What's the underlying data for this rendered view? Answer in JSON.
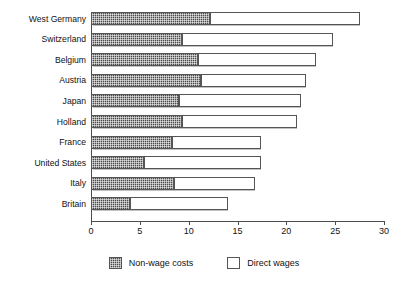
{
  "chart_data": {
    "type": "bar",
    "orientation": "horizontal",
    "stacked": true,
    "title": "",
    "xlabel": "",
    "ylabel": "",
    "xlim": [
      0,
      30
    ],
    "xticks": [
      0,
      5,
      10,
      15,
      20,
      25,
      30
    ],
    "xtick_labels": [
      "0",
      "5",
      "10",
      "15",
      "20",
      "25",
      "30"
    ],
    "grid": false,
    "legend_position": "bottom",
    "categories": [
      "West Germany",
      "Switzerland",
      "Belgium",
      "Austria",
      "Japan",
      "Holland",
      "France",
      "United States",
      "Italy",
      "Britain"
    ],
    "series": [
      {
        "name": "Non-wage costs",
        "color": "#4a4a4a",
        "fill": "checkered-dark",
        "values": [
          12.2,
          9.3,
          11.0,
          11.3,
          9.0,
          9.3,
          8.3,
          5.4,
          8.5,
          4.0
        ]
      },
      {
        "name": "Direct wages",
        "color": "#ffffff",
        "fill": "white",
        "values": [
          15.3,
          15.5,
          12.0,
          10.7,
          12.5,
          11.8,
          9.1,
          12.0,
          8.3,
          10.0
        ]
      }
    ],
    "totals": [
      27.5,
      24.8,
      23.0,
      22.0,
      21.5,
      21.1,
      17.4,
      17.4,
      16.8,
      14.0
    ]
  },
  "legend": {
    "items": [
      {
        "label": "Non-wage costs",
        "swatch": "checkered-dark"
      },
      {
        "label": "Direct wages",
        "swatch": "white-outline"
      }
    ]
  }
}
